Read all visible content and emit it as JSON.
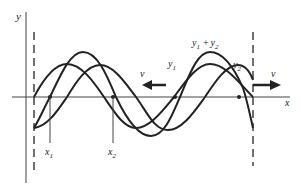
{
  "diagram": {
    "axes": {
      "y_label": "y",
      "x_label": "x"
    },
    "waves": [
      {
        "label": "y",
        "sub": "1",
        "description": "wave traveling left"
      },
      {
        "label": "y",
        "sub": "2",
        "description": "wave traveling right"
      },
      {
        "label_sum": "y",
        "sub_a": "1",
        "plus": "+",
        "label_b": "y",
        "sub_b": "2",
        "description": "superposition"
      }
    ],
    "velocity_left": {
      "label": "v",
      "direction": "left"
    },
    "velocity_right": {
      "label": "v",
      "direction": "right"
    },
    "markers": [
      {
        "label": "x",
        "sub": "1"
      },
      {
        "label": "x",
        "sub": "2"
      }
    ],
    "colors": {
      "stroke": "#222222",
      "axis": "#444444",
      "background": "#ffffff"
    }
  }
}
